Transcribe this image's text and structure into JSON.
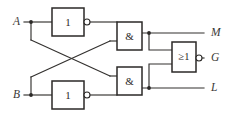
{
  "diagram": {
    "type": "logic-circuit",
    "background_color": "#ffffff",
    "line_color": "#33312f",
    "gate_border_color": "#2b2927",
    "label_color": "#3a3836"
  },
  "inputs": [
    {
      "id": "A",
      "label": "A",
      "x": 31,
      "y": 22
    },
    {
      "id": "B",
      "label": "B",
      "x": 31,
      "y": 95
    }
  ],
  "outputs": [
    {
      "id": "M",
      "label": "M",
      "x": 213,
      "y": 33
    },
    {
      "id": "G",
      "label": "G",
      "x": 213,
      "y": 58
    },
    {
      "id": "L",
      "label": "L",
      "x": 213,
      "y": 88
    }
  ],
  "gates": [
    {
      "id": "not-top",
      "kind": "NOT",
      "label": "1",
      "inverted_output": true,
      "x": 52,
      "y": 8,
      "w": 32,
      "h": 28
    },
    {
      "id": "not-bottom",
      "kind": "NOT",
      "label": "1",
      "inverted_output": true,
      "x": 52,
      "y": 81,
      "w": 32,
      "h": 28
    },
    {
      "id": "and-top",
      "kind": "AND",
      "label": "&",
      "inverted_output": false,
      "x": 117,
      "y": 22,
      "w": 25,
      "h": 28
    },
    {
      "id": "and-bottom",
      "kind": "AND",
      "label": "&",
      "inverted_output": false,
      "x": 117,
      "y": 67,
      "w": 25,
      "h": 28
    },
    {
      "id": "nor",
      "kind": "NOR",
      "label": "≥1",
      "inverted_output": true,
      "x": 172,
      "y": 42,
      "w": 24,
      "h": 30
    }
  ],
  "junctions": [
    {
      "id": "j-a",
      "x": 31,
      "y": 22
    },
    {
      "id": "j-b",
      "x": 31,
      "y": 95
    },
    {
      "id": "j-m",
      "x": 149,
      "y": 33
    },
    {
      "id": "j-l",
      "x": 149,
      "y": 88
    }
  ],
  "wires": [
    {
      "id": "w-a-stub",
      "d": "M 24 22 L 52 22"
    },
    {
      "id": "w-a-down",
      "d": "M 31 22 L 31 40"
    },
    {
      "id": "w-a-cross",
      "d": "M 31 40 L 110 76"
    },
    {
      "id": "w-b-stub",
      "d": "M 24 95 L 52 95"
    },
    {
      "id": "w-b-up",
      "d": "M 31 95 L 31 77"
    },
    {
      "id": "w-b-cross",
      "d": "M 31 77 L 110 41"
    },
    {
      "id": "w-not-top-out",
      "d": "M 89 22 L 117 22"
    },
    {
      "id": "w-not-bot-out",
      "d": "M 89 95 L 117 95"
    },
    {
      "id": "w-cross-to-and-top",
      "d": "M 110 41 L 117 41"
    },
    {
      "id": "w-cross-to-and-bottom",
      "d": "M 110 76 L 117 76"
    },
    {
      "id": "w-and-top-out",
      "d": "M 142 33 L 204 33"
    },
    {
      "id": "w-and-bot-out",
      "d": "M 142 88 L 204 88"
    },
    {
      "id": "w-m-tap",
      "d": "M 149 33 L 149 50 L 172 50"
    },
    {
      "id": "w-l-tap",
      "d": "M 149 88 L 149 64 L 172 64"
    },
    {
      "id": "w-nor-out",
      "d": "M 201 58 L 204 58"
    }
  ]
}
